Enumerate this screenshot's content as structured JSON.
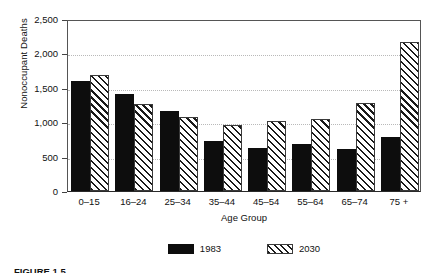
{
  "chart_data": {
    "type": "bar",
    "title": "",
    "xlabel": "Age Group",
    "ylabel": "Nonoccupant Deaths",
    "categories": [
      "0–15",
      "16–24",
      "25–34",
      "35–44",
      "45–54",
      "55–64",
      "65–74",
      "75 +"
    ],
    "series": [
      {
        "name": "1983",
        "values": [
          1600,
          1410,
          1170,
          720,
          620,
          680,
          610,
          780
        ],
        "color": "#0d0d0d",
        "fill": "solid"
      },
      {
        "name": "2030",
        "values": [
          1690,
          1265,
          1080,
          960,
          1020,
          1045,
          1285,
          2160
        ],
        "color": "#1a1a1a",
        "fill": "diagonal-hatch"
      }
    ],
    "ylim": [
      0,
      2500
    ],
    "ytick_values": [
      0,
      500,
      1000,
      1500,
      2000,
      2500
    ],
    "ytick_labels": [
      "0",
      "500",
      "1,000",
      "1,500",
      "2,000",
      "2,500"
    ],
    "grid": "horizontal-dotted",
    "legend_position": "bottom-center"
  },
  "axes": {
    "y_title": "Nonoccupant Deaths",
    "x_title": "Age Group"
  },
  "legend": {
    "items": [
      {
        "label": "1983",
        "swatch": "solid-black-swatch"
      },
      {
        "label": "2030",
        "swatch": "diagonal-hatch-swatch"
      }
    ]
  },
  "caption": {
    "text": "FIGURE 1.5"
  },
  "colors": {
    "series_1983": "#0d0d0d",
    "series_2030": "#1a1a1a",
    "axis": "#444444",
    "gridline": "#b9b9b9",
    "background": "#ffffff"
  }
}
